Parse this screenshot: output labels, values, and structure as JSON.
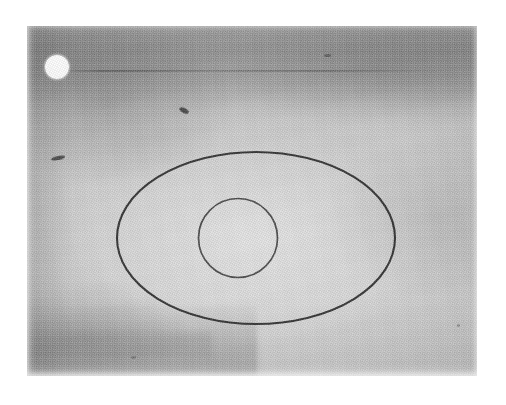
{
  "figure": {
    "caption": "",
    "plate": {
      "x": 27,
      "y": 26,
      "width": 450,
      "height": 350,
      "background_tone": "#cbcbcb",
      "description": "Grainy halftone-printed photographic plate with mottled gray texture"
    },
    "shapes": [
      {
        "id": "outer-ellipse",
        "type": "ellipse",
        "center_x": 256,
        "center_y": 238,
        "radius_x": 139,
        "radius_y": 86,
        "stroke": "#2b2b2b",
        "stroke_width": 2.1,
        "fill": "none",
        "label": "outer ellipse outline"
      },
      {
        "id": "inner-circle",
        "type": "circle",
        "center_x": 238,
        "center_y": 238,
        "radius": 39.5,
        "stroke": "#3a3a3a",
        "stroke_width": 1.7,
        "fill": "none",
        "label": "inner circle outline"
      }
    ],
    "marker": {
      "id": "white-dot-marker",
      "type": "filled-circle",
      "center_x": 57,
      "center_y": 67,
      "radius": 12,
      "color": "#ffffff",
      "label": "bright white reference dot"
    },
    "tonal_regions": [
      {
        "name": "top-dark-band",
        "note": "darker horizontal band across upper portion of plate"
      },
      {
        "name": "horizontal-scratch",
        "note": "faint dark horizontal line within the top band"
      },
      {
        "name": "bottom-left-band",
        "note": "darker shading along lower-left of plate"
      },
      {
        "name": "center-highlight",
        "note": "lighter region surrounding the ellipse"
      }
    ],
    "specks": [
      {
        "name": "speck-left",
        "x": 51,
        "y": 156
      },
      {
        "name": "speck-upper-mid",
        "x": 179,
        "y": 108
      },
      {
        "name": "speck-top-right",
        "x": 324,
        "y": 54
      },
      {
        "name": "speck-lower-right",
        "x": 457,
        "y": 324
      },
      {
        "name": "speck-bottom-left",
        "x": 131,
        "y": 356
      }
    ],
    "colors": {
      "page_background": "#ffffff",
      "plate_mid_tone": "#cbcbcb",
      "plate_dark_tone": "#8d8d8d",
      "ink_stroke": "#2b2b2b",
      "marker_white": "#ffffff"
    }
  }
}
